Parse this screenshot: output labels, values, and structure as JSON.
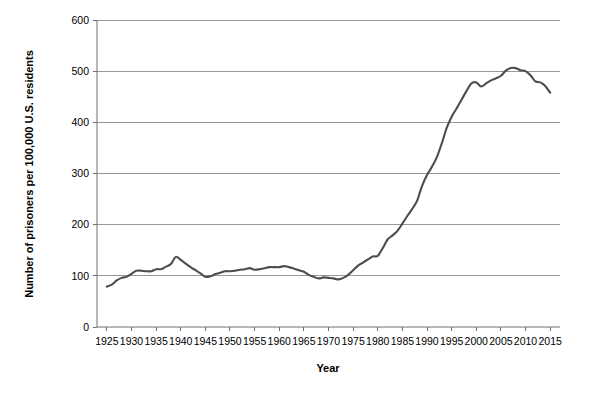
{
  "chart_data": {
    "type": "line",
    "title": "",
    "xlabel": "Year",
    "ylabel": "Number of prisoners per 100,000 U.S. residents",
    "xlim": [
      1923,
      2017
    ],
    "ylim": [
      0,
      600
    ],
    "grid": "horizontal",
    "legend": "none",
    "line_color": "#4d4d4d",
    "axis_color": "#6f6f6f",
    "grid_color": "#8c8c8c",
    "background_color": "#ffffff",
    "y_ticks": [
      0,
      100,
      200,
      300,
      400,
      500,
      600
    ],
    "x_ticks": [
      1925,
      1930,
      1935,
      1940,
      1945,
      1950,
      1955,
      1960,
      1965,
      1970,
      1975,
      1980,
      1985,
      1990,
      1995,
      2000,
      2005,
      2010,
      2015
    ],
    "x": [
      1925,
      1926,
      1927,
      1928,
      1929,
      1930,
      1931,
      1932,
      1933,
      1934,
      1935,
      1936,
      1937,
      1938,
      1939,
      1940,
      1941,
      1942,
      1943,
      1944,
      1945,
      1946,
      1947,
      1948,
      1949,
      1950,
      1951,
      1952,
      1953,
      1954,
      1955,
      1956,
      1957,
      1958,
      1959,
      1960,
      1961,
      1962,
      1963,
      1964,
      1965,
      1966,
      1967,
      1968,
      1969,
      1970,
      1971,
      1972,
      1973,
      1974,
      1975,
      1976,
      1977,
      1978,
      1979,
      1980,
      1981,
      1982,
      1983,
      1984,
      1985,
      1986,
      1987,
      1988,
      1989,
      1990,
      1991,
      1992,
      1993,
      1994,
      1995,
      1996,
      1997,
      1998,
      1999,
      2000,
      2001,
      2002,
      2003,
      2004,
      2005,
      2006,
      2007,
      2008,
      2009,
      2010,
      2011,
      2012,
      2013,
      2014,
      2015
    ],
    "values": [
      79,
      83,
      91,
      96,
      98,
      104,
      110,
      110,
      109,
      109,
      113,
      113,
      118,
      123,
      137,
      131,
      124,
      117,
      111,
      105,
      98,
      99,
      103,
      106,
      109,
      109,
      110,
      112,
      113,
      115,
      112,
      113,
      115,
      117,
      117,
      117,
      119,
      117,
      114,
      111,
      108,
      102,
      98,
      95,
      97,
      96,
      95,
      93,
      96,
      102,
      111,
      120,
      126,
      132,
      138,
      139,
      154,
      171,
      179,
      188,
      202,
      217,
      231,
      247,
      276,
      297,
      313,
      332,
      359,
      389,
      411,
      427,
      444,
      461,
      476,
      478,
      470,
      476,
      482,
      486,
      491,
      501,
      506,
      506,
      502,
      500,
      492,
      480,
      478,
      471,
      458
    ]
  },
  "axis": {
    "x_title": "Year",
    "y_title": "Number of prisoners per 100,000 U.S. residents"
  }
}
